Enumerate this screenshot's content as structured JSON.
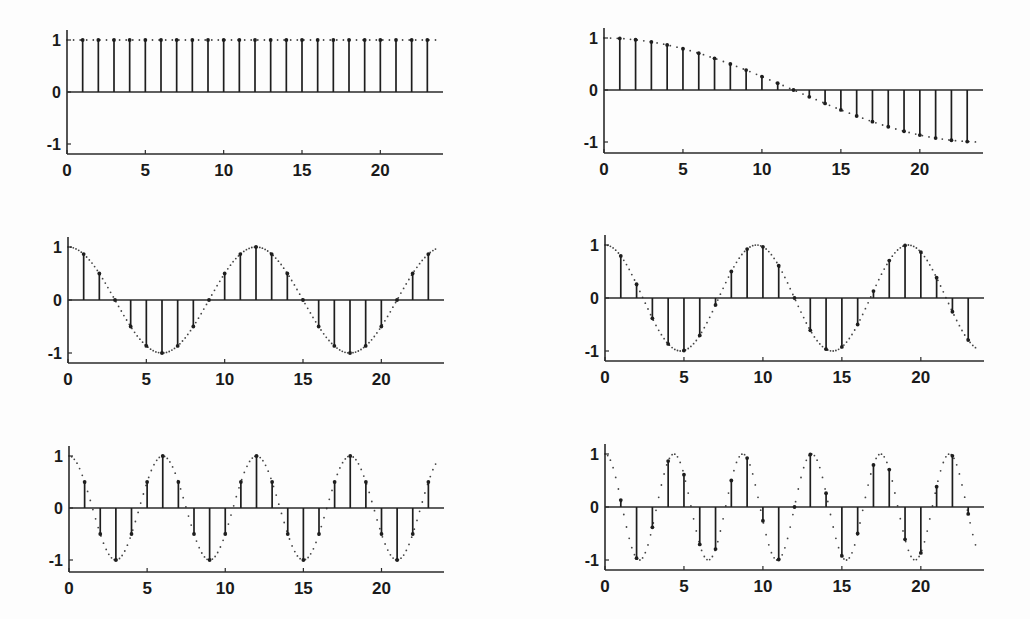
{
  "figure": {
    "background": "#fdfdfd",
    "stem_color": "#1e1e1e",
    "envelope_color": "#444444",
    "layout": "3 rows x 2 columns of stem plots"
  },
  "chart_data": [
    {
      "type": "stem",
      "panel": "row1-left",
      "title": "",
      "xlabel": "",
      "ylabel": "",
      "xlim": [
        0,
        24
      ],
      "ylim": [
        -1.2,
        1.2
      ],
      "xticks": [
        0,
        5,
        10,
        15,
        20
      ],
      "xtick_labels": [
        "0",
        "5",
        "10",
        "15",
        "20"
      ],
      "yticks": [
        1,
        0,
        -1
      ],
      "ytick_labels": [
        "1",
        "0",
        "-1"
      ],
      "grid": false,
      "envelope": "dashed continuous cosine, frequency k=0 (constant 1)",
      "k": 0,
      "x": [
        1,
        2,
        3,
        4,
        5,
        6,
        7,
        8,
        9,
        10,
        11,
        12,
        13,
        14,
        15,
        16,
        17,
        18,
        19,
        20,
        21,
        22,
        23
      ],
      "values": [
        1,
        1,
        1,
        1,
        1,
        1,
        1,
        1,
        1,
        1,
        1,
        1,
        1,
        1,
        1,
        1,
        1,
        1,
        1,
        1,
        1,
        1,
        1
      ]
    },
    {
      "type": "stem",
      "panel": "row1-right",
      "title": "",
      "xlabel": "",
      "ylabel": "",
      "xlim": [
        0,
        24
      ],
      "ylim": [
        -1.2,
        1.2
      ],
      "xticks": [
        0,
        5,
        10,
        15,
        20
      ],
      "xtick_labels": [
        "0",
        "5",
        "10",
        "15",
        "20"
      ],
      "yticks": [
        1,
        0,
        -1
      ],
      "ytick_labels": [
        "1",
        "0",
        "-1"
      ],
      "grid": false,
      "envelope": "dashed continuous cosine cos(pi*t/24)",
      "k": 1,
      "x": [
        1,
        2,
        3,
        4,
        5,
        6,
        7,
        8,
        9,
        10,
        11,
        12,
        13,
        14,
        15,
        16,
        17,
        18,
        19,
        20,
        21,
        22,
        23
      ],
      "values": [
        0.991,
        0.966,
        0.924,
        0.866,
        0.793,
        0.707,
        0.609,
        0.5,
        0.383,
        0.259,
        0.131,
        0,
        -0.131,
        -0.259,
        -0.383,
        -0.5,
        -0.609,
        -0.707,
        -0.793,
        -0.866,
        -0.924,
        -0.966,
        -0.991
      ]
    },
    {
      "type": "stem",
      "panel": "row2-left",
      "title": "",
      "xlabel": "",
      "ylabel": "",
      "xlim": [
        0,
        24
      ],
      "ylim": [
        -1.2,
        1.2
      ],
      "xticks": [
        0,
        5,
        10,
        15,
        20
      ],
      "xtick_labels": [
        "0",
        "5",
        "10",
        "15",
        "20"
      ],
      "yticks": [
        1,
        0,
        -1
      ],
      "ytick_labels": [
        "1",
        "0",
        "-1"
      ],
      "grid": false,
      "envelope": "dotted continuous cosine cos(4*pi*t/24)",
      "k": 4,
      "x": [
        1,
        2,
        3,
        4,
        5,
        6,
        7,
        8,
        9,
        10,
        11,
        12,
        13,
        14,
        15,
        16,
        17,
        18,
        19,
        20,
        21,
        22,
        23
      ],
      "values": [
        0.866,
        0.5,
        0,
        -0.5,
        -0.866,
        -1,
        -0.866,
        -0.5,
        0,
        0.5,
        0.866,
        1,
        0.866,
        0.5,
        0,
        -0.5,
        -0.866,
        -1,
        -0.866,
        -0.5,
        0,
        0.5,
        0.866
      ]
    },
    {
      "type": "stem",
      "panel": "row2-right",
      "title": "",
      "xlabel": "",
      "ylabel": "",
      "xlim": [
        0,
        24
      ],
      "ylim": [
        -1.2,
        1.2
      ],
      "xticks": [
        0,
        5,
        10,
        15,
        20
      ],
      "xtick_labels": [
        "0",
        "5",
        "10",
        "15",
        "20"
      ],
      "yticks": [
        1,
        0,
        -1
      ],
      "ytick_labels": [
        "1",
        "0",
        "-1"
      ],
      "grid": false,
      "envelope": "dotted continuous cosine cos(5*pi*t/24)",
      "k": 5,
      "x": [
        1,
        2,
        3,
        4,
        5,
        6,
        7,
        8,
        9,
        10,
        11,
        12,
        13,
        14,
        15,
        16,
        17,
        18,
        19,
        20,
        21,
        22,
        23
      ],
      "values": [
        0.793,
        0.259,
        -0.383,
        -0.866,
        -0.991,
        -0.707,
        -0.131,
        0.5,
        0.924,
        0.966,
        0.609,
        0,
        -0.609,
        -0.966,
        -0.924,
        -0.5,
        0.131,
        0.707,
        0.991,
        0.866,
        0.383,
        -0.259,
        -0.793
      ]
    },
    {
      "type": "stem",
      "panel": "row3-left",
      "title": "",
      "xlabel": "",
      "ylabel": "",
      "xlim": [
        0,
        24
      ],
      "ylim": [
        -1.2,
        1.2
      ],
      "xticks": [
        0,
        5,
        10,
        15,
        20
      ],
      "xtick_labels": [
        "0",
        "5",
        "10",
        "15",
        "20"
      ],
      "yticks": [
        1,
        0,
        -1
      ],
      "ytick_labels": [
        "1",
        "0",
        "-1"
      ],
      "grid": false,
      "envelope": "dotted continuous cosine cos(8*pi*t/24)",
      "k": 8,
      "x": [
        1,
        2,
        3,
        4,
        5,
        6,
        7,
        8,
        9,
        10,
        11,
        12,
        13,
        14,
        15,
        16,
        17,
        18,
        19,
        20,
        21,
        22,
        23
      ],
      "values": [
        0.5,
        -0.5,
        -1,
        -0.5,
        0.5,
        1,
        0.5,
        -0.5,
        -1,
        -0.5,
        0.5,
        1,
        0.5,
        -0.5,
        -1,
        -0.5,
        0.5,
        1,
        0.5,
        -0.5,
        -1,
        -0.5,
        0.5
      ]
    },
    {
      "type": "stem",
      "panel": "row3-right",
      "title": "",
      "xlabel": "",
      "ylabel": "",
      "xlim": [
        0,
        24
      ],
      "ylim": [
        -1.2,
        1.2
      ],
      "xticks": [
        0,
        5,
        10,
        15,
        20
      ],
      "xtick_labels": [
        "0",
        "5",
        "10",
        "15",
        "20"
      ],
      "yticks": [
        1,
        0,
        -1
      ],
      "ytick_labels": [
        "1",
        "0",
        "-1"
      ],
      "grid": false,
      "envelope": "dotted continuous cosine cos(11*pi*t/24)",
      "k": 11,
      "x": [
        1,
        2,
        3,
        4,
        5,
        6,
        7,
        8,
        9,
        10,
        11,
        12,
        13,
        14,
        15,
        16,
        17,
        18,
        19,
        20,
        21,
        22,
        23
      ],
      "values": [
        0.131,
        -0.966,
        -0.383,
        0.866,
        0.609,
        -0.707,
        -0.793,
        0.5,
        0.924,
        -0.259,
        -0.991,
        0,
        0.991,
        0.259,
        -0.924,
        -0.5,
        0.793,
        0.707,
        -0.609,
        -0.866,
        0.383,
        0.966,
        -0.131
      ]
    }
  ]
}
